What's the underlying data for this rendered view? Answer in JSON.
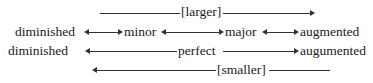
{
  "rows": {
    "r1": {
      "label": "[larger]"
    },
    "r2": {
      "left": "diminished",
      "minor": "minor",
      "major": "major",
      "right": "augmented"
    },
    "r3": {
      "left": "diminished",
      "center": "perfect",
      "right": "augumented"
    },
    "r4": {
      "label": "[smaller]"
    }
  }
}
